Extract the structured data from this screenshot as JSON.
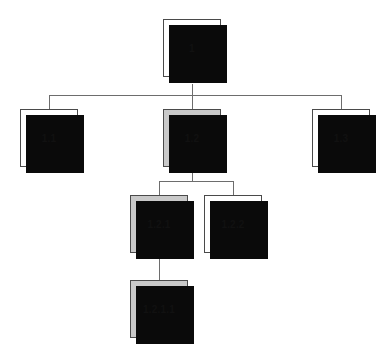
{
  "diagram": {
    "type": "tree",
    "background_color": "#ffffff",
    "line_color": "#6d6d6d",
    "border_color": "#4a4a4a",
    "shadow_color": "#0a0a0a",
    "fill_default": "#ffffff",
    "fill_highlight": "#c9c9c9",
    "text_color": "#111111",
    "nodes": [
      {
        "id": "n1",
        "label": "1",
        "level": 0,
        "shaded": false,
        "x": 163,
        "y": 19,
        "w": 58,
        "h": 58
      },
      {
        "id": "n1-1",
        "label": "1.1",
        "level": 1,
        "shaded": false,
        "x": 20,
        "y": 109,
        "w": 58,
        "h": 58
      },
      {
        "id": "n1-2",
        "label": "1.2",
        "level": 1,
        "shaded": true,
        "x": 163,
        "y": 109,
        "w": 58,
        "h": 58
      },
      {
        "id": "n1-3",
        "label": "1.3",
        "level": 1,
        "shaded": false,
        "x": 312,
        "y": 109,
        "w": 58,
        "h": 58
      },
      {
        "id": "n1-2-1",
        "label": "1.2.1",
        "level": 2,
        "shaded": true,
        "x": 130,
        "y": 195,
        "w": 58,
        "h": 58
      },
      {
        "id": "n1-2-2",
        "label": "1.2.2",
        "level": 2,
        "shaded": false,
        "x": 204,
        "y": 195,
        "w": 58,
        "h": 58
      },
      {
        "id": "n1-2-1-1",
        "label": "1.2.1.1",
        "level": 3,
        "shaded": true,
        "x": 130,
        "y": 280,
        "w": 58,
        "h": 58
      }
    ],
    "edges": [
      {
        "from": "n1",
        "to": "n1-1"
      },
      {
        "from": "n1",
        "to": "n1-2"
      },
      {
        "from": "n1",
        "to": "n1-3"
      },
      {
        "from": "n1-2",
        "to": "n1-2-1"
      },
      {
        "from": "n1-2",
        "to": "n1-2-2"
      },
      {
        "from": "n1-2-1",
        "to": "n1-2-1-1"
      }
    ]
  }
}
